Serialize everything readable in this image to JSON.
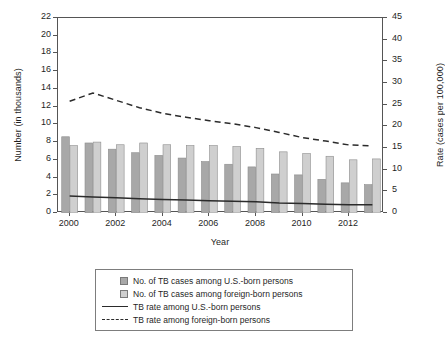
{
  "chart_data": {
    "type": "bar",
    "title": "",
    "subtitle": "",
    "xlabel": "Year",
    "ylabel": "Number (in thousands)",
    "ylabel_right": "Rate (cases per 100,000)",
    "grid": false,
    "legend_position": "bottom",
    "x": [
      2000,
      2001,
      2002,
      2003,
      2004,
      2005,
      2006,
      2007,
      2008,
      2009,
      2010,
      2011,
      2012,
      2013
    ],
    "categories": [
      "2000",
      "2001",
      "2002",
      "2003",
      "2004",
      "2005",
      "2006",
      "2007",
      "2008",
      "2009",
      "2010",
      "2011",
      "2012",
      "2013"
    ],
    "xtick_labels": [
      "2000",
      "2002",
      "2004",
      "2006",
      "2008",
      "2010",
      "2012"
    ],
    "xtick_values": [
      2000,
      2002,
      2004,
      2006,
      2008,
      2010,
      2012
    ],
    "ylim": [
      0,
      22
    ],
    "ytick_labels": [
      "0",
      "2",
      "4",
      "6",
      "8",
      "10",
      "12",
      "14",
      "16",
      "18",
      "20",
      "22"
    ],
    "ytick_values": [
      0,
      2,
      4,
      6,
      8,
      10,
      12,
      14,
      16,
      18,
      20,
      22
    ],
    "ylim_right": [
      0,
      45
    ],
    "ytick_labels_right": [
      "0",
      "5",
      "10",
      "15",
      "20",
      "25",
      "30",
      "35",
      "40",
      "45"
    ],
    "ytick_values_right": [
      0,
      5,
      10,
      15,
      20,
      25,
      30,
      35,
      40,
      45
    ],
    "series": [
      {
        "name": "No. of TB cases among U.S.-born persons",
        "type": "bar",
        "axis": "left",
        "color": "#a8a8a8",
        "values": [
          8.6,
          7.9,
          7.2,
          6.8,
          6.5,
          6.2,
          5.8,
          5.5,
          5.2,
          4.4,
          4.3,
          3.8,
          3.4,
          3.2
        ]
      },
      {
        "name": "No. of TB cases among foreign-born persons",
        "type": "bar",
        "axis": "left",
        "color": "#cfcfcf",
        "values": [
          7.6,
          8.0,
          7.7,
          7.9,
          7.7,
          7.6,
          7.6,
          7.5,
          7.3,
          6.9,
          6.7,
          6.4,
          6.0,
          6.1
        ]
      },
      {
        "name": "TB rate among U.S.-born persons",
        "type": "line",
        "axis": "right",
        "style": "solid",
        "color": "#2b2b2b",
        "values": [
          3.9,
          3.7,
          3.5,
          3.3,
          3.1,
          3.0,
          2.8,
          2.7,
          2.6,
          2.3,
          2.2,
          2.0,
          1.9,
          1.9
        ]
      },
      {
        "name": "TB rate among foreign-born persons",
        "type": "line",
        "axis": "right",
        "style": "dashed",
        "color": "#2b2b2b",
        "values": [
          25.8,
          27.7,
          26.0,
          24.3,
          23.0,
          22.1,
          21.3,
          20.6,
          19.7,
          18.6,
          17.4,
          16.6,
          15.7,
          15.5
        ]
      }
    ]
  },
  "legend": {
    "items": [
      {
        "key": "swatch-us",
        "label": "No. of TB cases among U.S.-born persons"
      },
      {
        "key": "swatch-fb",
        "label": "No. of TB cases among foreign-born persons"
      },
      {
        "key": "line-solid",
        "label": "TB rate among U.S.-born persons"
      },
      {
        "key": "line-dashed",
        "label": "TB rate among foreign-born persons"
      }
    ]
  },
  "colors": {
    "bar_us_born": "#a8a8a8",
    "bar_foreign_born": "#cfcfcf",
    "line": "#2b2b2b",
    "axis": "#555555",
    "background": "#ffffff"
  }
}
